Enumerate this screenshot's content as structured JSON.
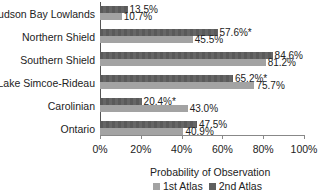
{
  "chart_data": {
    "type": "bar",
    "orientation": "horizontal",
    "title": "",
    "xlabel": "Probability of Observation",
    "ylabel": "",
    "xlim": [
      0,
      100
    ],
    "x_ticks": [
      "0%",
      "20%",
      "40%",
      "60%",
      "80%",
      "100%"
    ],
    "grid": false,
    "legend_position": "bottom",
    "categories": [
      "Hudson Bay Lowlands",
      "Northern Shield",
      "Southern Shield",
      "Lake Simcoe-Rideau",
      "Carolinian",
      "Ontario"
    ],
    "series": [
      {
        "name": "2nd Atlas",
        "color": "#5f5f5f",
        "values": [
          13.5,
          57.6,
          84.6,
          65.2,
          20.4,
          47.5
        ],
        "labels": [
          "13.5%",
          "57.6%*",
          "84.6%",
          "65.2%*",
          "20.4%*",
          "47.5%"
        ]
      },
      {
        "name": "1st Atlas",
        "color": "#a3a3a3",
        "values": [
          10.7,
          45.5,
          81.2,
          75.7,
          43.0,
          40.9
        ],
        "labels": [
          "10.7%",
          "45.5%",
          "81.2%",
          "75.7%",
          "43.0%",
          "40.9%"
        ]
      }
    ],
    "annotations": [
      "* marks significant change between atlases"
    ]
  },
  "legend": {
    "first": "1st Atlas",
    "second": "2nd Atlas"
  }
}
